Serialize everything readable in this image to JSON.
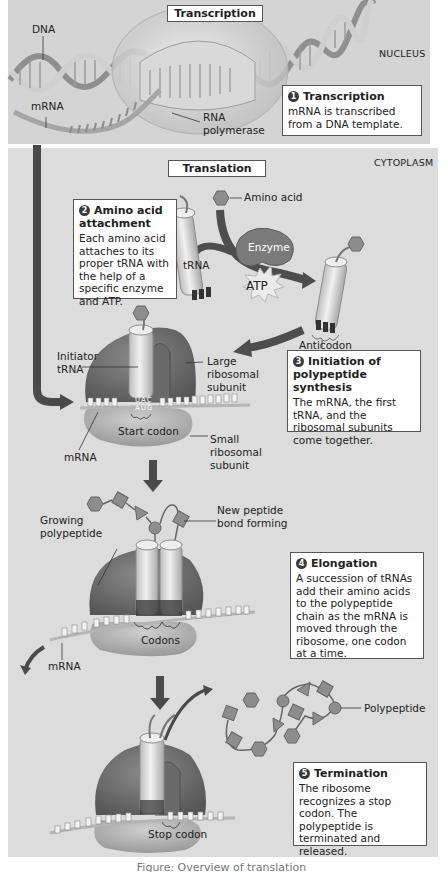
{
  "regions": {
    "nucleus": "Nucleus",
    "cytoplasm": "Cytoplasm"
  },
  "titles": {
    "transcription": "Transcription",
    "translation": "Translation"
  },
  "labels": {
    "dna": "DNA",
    "mrna_top": "mRNA",
    "rna_polymerase_1": "RNA",
    "rna_polymerase_2": "polymerase",
    "amino_acid": "Amino acid",
    "enzyme": "Enzyme",
    "trna": "tRNA",
    "atp": "ATP",
    "anticodon": "Anticodon",
    "initiator_trna_1": "Initiator",
    "initiator_trna_2": "tRNA",
    "large_subunit_1": "Large",
    "large_subunit_2": "ribosomal",
    "large_subunit_3": "subunit",
    "small_subunit_1": "Small",
    "small_subunit_2": "ribosomal",
    "small_subunit_3": "subunit",
    "start_codon": "Start codon",
    "mrna_init": "mRNA",
    "anticodon_letters": "UAC",
    "codon_letters": "AUG",
    "growing_polypeptide_1": "Growing",
    "growing_polypeptide_2": "polypeptide",
    "new_peptide_bond_1": "New peptide",
    "new_peptide_bond_2": "bond forming",
    "codons": "Codons",
    "mrna_elong": "mRNA",
    "polypeptide": "Polypeptide",
    "stop_codon": "Stop codon"
  },
  "steps": [
    {
      "number": "1",
      "title": "Transcription",
      "body": "mRNA is transcribed from a DNA template."
    },
    {
      "number": "2",
      "title": "Amino acid attachment",
      "body": "Each amino acid attaches to its proper tRNA with the help of a specific enzyme and ATP."
    },
    {
      "number": "3",
      "title": "Initiation of polypeptide synthesis",
      "body": "The mRNA, the first tRNA, and the ribosomal subunits come together."
    },
    {
      "number": "4",
      "title": "Elongation",
      "body": "A succession of tRNAs add their amino acids to the polypeptide chain as the mRNA is moved through the ribosome, one codon at a time."
    },
    {
      "number": "5",
      "title": "Termination",
      "body": "The ribosome recognizes a stop codon. The polypeptide is terminated and released."
    }
  ],
  "caption": "Figure: Overview of translation",
  "colors": {
    "background_nucleus": "#d4d4d4",
    "background_cytoplasm": "#dcdcdc",
    "ribosome_large": "#6e6e6e",
    "ribosome_small": "#b4b4b4",
    "arrow": "#4a4a4a",
    "trna": "#e8e8e8",
    "amino_acid": "#8a8a8a"
  }
}
